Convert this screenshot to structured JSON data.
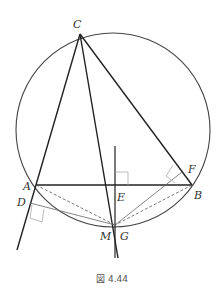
{
  "figure": {
    "caption": "図 4.44",
    "colors": {
      "line": "#222222",
      "circle": "#444444",
      "thin": "#777777",
      "right_angle": "#aaaaaa"
    },
    "points": {
      "C": "C",
      "A": "A",
      "B": "B",
      "D": "D",
      "E": "E",
      "F": "F",
      "M": "M",
      "G": "G"
    }
  }
}
